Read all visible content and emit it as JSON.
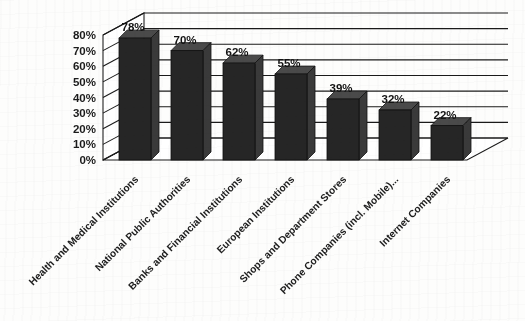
{
  "chart_data": {
    "type": "bar",
    "title": "",
    "subtitle": "",
    "xlabel": "",
    "ylabel": "",
    "ylim": [
      0,
      80
    ],
    "ytick_step": 10,
    "ytick_labels": [
      "0%",
      "10%",
      "20%",
      "30%",
      "40%",
      "50%",
      "60%",
      "70%",
      "80%"
    ],
    "ytick_values": [
      0,
      10,
      20,
      30,
      40,
      50,
      60,
      70,
      80
    ],
    "grid": true,
    "legend": false,
    "legend_position": "none",
    "three_d": true,
    "orientation": "vertical",
    "value_suffix": "%",
    "categories": [
      "Health and Medical Institutions",
      "National Public Authorities",
      "Banks and Financial Institutions",
      "European Institutions",
      "Shops and Department Stores",
      "Phone Companies (incl. Mobile)...",
      "Internet Companies"
    ],
    "values": [
      78,
      70,
      62,
      55,
      39,
      32,
      22
    ],
    "data_labels": [
      "78%",
      "70%",
      "62%",
      "55%",
      "39%",
      "32%",
      "22%"
    ],
    "colors": {
      "bar_front": "#262626",
      "bar_side": "#3a3a3a",
      "bar_top": "#4a4a4a",
      "grid": "#1a1a1a",
      "text": "#1b1b1b",
      "background": "#fdfdfc"
    }
  }
}
